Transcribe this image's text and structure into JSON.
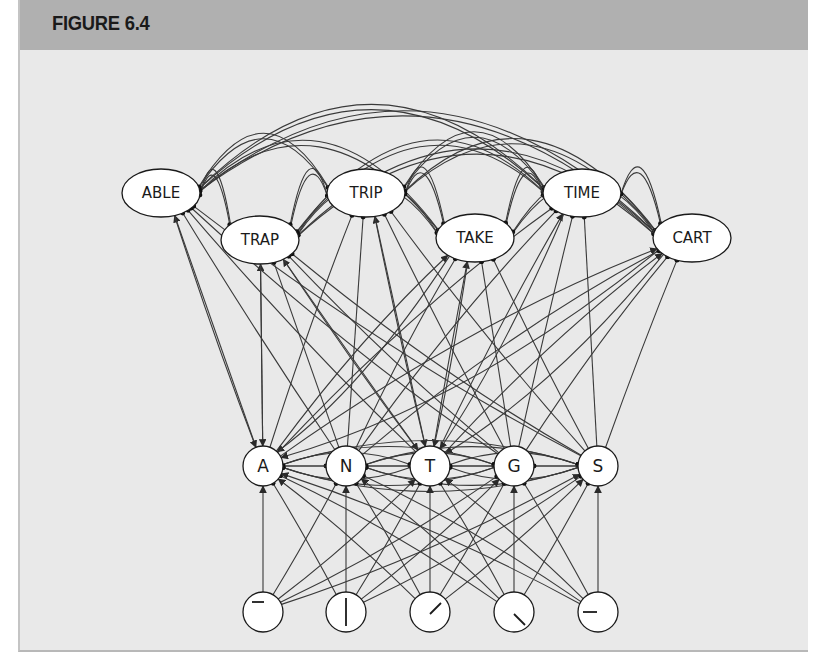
{
  "figure": {
    "title": "FIGURE 6.4"
  },
  "network": {
    "word_nodes": [
      {
        "label": "ABLE",
        "x": 161,
        "y": 193
      },
      {
        "label": "TRAP",
        "x": 260,
        "y": 240
      },
      {
        "label": "TRIP",
        "x": 366,
        "y": 193
      },
      {
        "label": "TAKE",
        "x": 475,
        "y": 238
      },
      {
        "label": "TIME",
        "x": 582,
        "y": 193
      },
      {
        "label": "CART",
        "x": 692,
        "y": 238
      }
    ],
    "letter_nodes": [
      {
        "label": "A",
        "x": 263,
        "y": 466
      },
      {
        "label": "N",
        "x": 346,
        "y": 466
      },
      {
        "label": "T",
        "x": 430,
        "y": 466
      },
      {
        "label": "G",
        "x": 514,
        "y": 466
      },
      {
        "label": "S",
        "x": 598,
        "y": 466
      }
    ],
    "feature_nodes": [
      {
        "feature": "horizontal-bar-top",
        "x": 263,
        "y": 612
      },
      {
        "feature": "vertical-bar",
        "x": 346,
        "y": 612
      },
      {
        "feature": "diagonal-rising",
        "x": 430,
        "y": 612
      },
      {
        "feature": "diagonal-falling",
        "x": 514,
        "y": 612
      },
      {
        "feature": "horizontal-bar-middle",
        "x": 598,
        "y": 612
      }
    ],
    "connection_types": {
      "excitatory": "arrowhead",
      "inhibitory": "filled-dot"
    },
    "colors": {
      "line": "#3a3a3a",
      "node_fill": "#ffffff",
      "node_stroke": "#1a1a1a",
      "panel_bg": "#e9e9e9",
      "header_bg": "#b0b0b0"
    }
  }
}
